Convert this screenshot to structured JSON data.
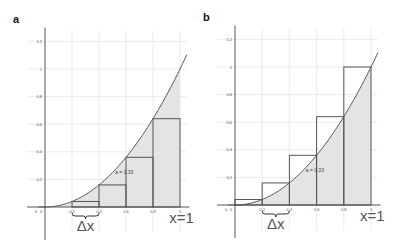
{
  "panels": [
    {
      "label": "a",
      "method": "left",
      "origin": {
        "x": 45,
        "y": 207
      },
      "unit_x": 135,
      "unit_y": 138,
      "y_ticks": [
        "0.2",
        "0.4",
        "0.6",
        "0.8",
        "1",
        "1.2"
      ],
      "x_ticks": [
        "0",
        "0.2",
        "0.4",
        "0.6",
        "0.8",
        "1"
      ],
      "origin_label": "0",
      "area_label": "a = 0.33",
      "delta_label": "Δx",
      "end_label": "x=1"
    },
    {
      "label": "b",
      "method": "right",
      "origin": {
        "x": 235,
        "y": 205
      },
      "unit_x": 136,
      "unit_y": 138,
      "y_ticks": [
        "0.2",
        "0.4",
        "0.6",
        "0.8",
        "1",
        "1.2"
      ],
      "x_ticks": [
        "0",
        "0.2",
        "0.4",
        "0.6",
        "0.8",
        "1"
      ],
      "origin_label": "0",
      "area_label": "a = 0.33",
      "delta_label": "Δx",
      "end_label": "x=1"
    }
  ],
  "chart_data": [
    {
      "type": "area",
      "title": "a",
      "function": "y = x^2",
      "series": [
        {
          "name": "curve y=x^2",
          "x": [
            0,
            0.2,
            0.4,
            0.6,
            0.8,
            1.0,
            1.05
          ],
          "values": [
            0,
            0.04,
            0.16,
            0.36,
            0.64,
            1.0,
            1.1025
          ]
        },
        {
          "name": "left rectangles",
          "x": [
            0.2,
            0.4,
            0.6,
            0.8
          ],
          "values": [
            0.04,
            0.16,
            0.36,
            0.64
          ]
        }
      ],
      "shaded_area_label": "a = 0.33",
      "annotations": [
        "Δx",
        "x=1"
      ],
      "x_ticks": [
        0,
        0.2,
        0.4,
        0.6,
        0.8,
        1
      ],
      "y_ticks": [
        0.2,
        0.4,
        0.6,
        0.8,
        1,
        1.2
      ],
      "xlim": [
        0,
        1.05
      ],
      "ylim": [
        0,
        1.25
      ],
      "grid": true
    },
    {
      "type": "area",
      "title": "b",
      "function": "y = x^2",
      "series": [
        {
          "name": "curve y=x^2",
          "x": [
            0,
            0.2,
            0.4,
            0.6,
            0.8,
            1.0,
            1.05
          ],
          "values": [
            0,
            0.04,
            0.16,
            0.36,
            0.64,
            1.0,
            1.1025
          ]
        },
        {
          "name": "right rectangles",
          "x": [
            0,
            0.2,
            0.4,
            0.6,
            0.8
          ],
          "values": [
            0.04,
            0.16,
            0.36,
            0.64,
            1.0
          ]
        }
      ],
      "shaded_area_label": "a = 0.33",
      "annotations": [
        "Δx",
        "x=1"
      ],
      "x_ticks": [
        0,
        0.2,
        0.4,
        0.6,
        0.8,
        1
      ],
      "y_ticks": [
        0.2,
        0.4,
        0.6,
        0.8,
        1,
        1.2
      ],
      "xlim": [
        0,
        1.05
      ],
      "ylim": [
        0,
        1.25
      ],
      "grid": true
    }
  ]
}
